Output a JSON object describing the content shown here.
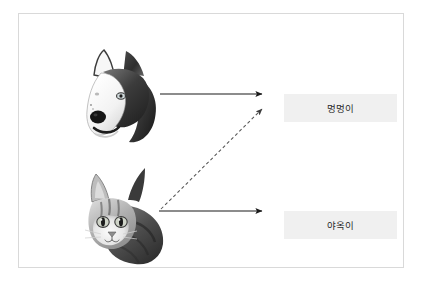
{
  "diagram": {
    "title_visible": false,
    "canvas": {
      "border_color": "#d9d9d9",
      "background_color": "#ffffff"
    },
    "nodes": [
      {
        "id": "dog-image",
        "type": "image",
        "semantic": "husky-dog-photo",
        "alt_text": "Husky dog head, grayscale photo",
        "position": "top-left"
      },
      {
        "id": "cat-image",
        "type": "image",
        "semantic": "tabby-cat-photo",
        "alt_text": "Tabby kitten head, grayscale photo",
        "position": "bottom-left"
      },
      {
        "id": "label-box-dog",
        "type": "label",
        "text": "멍멍이",
        "background_color": "#f0f0f0",
        "text_color": "#2b2b2b",
        "position": "top-right"
      },
      {
        "id": "label-box-cat",
        "type": "label",
        "text": "야옥이",
        "background_color": "#f0f0f0",
        "text_color": "#2b2b2b",
        "position": "bottom-right"
      }
    ],
    "edges": [
      {
        "id": "arrow-dog-to-meong",
        "from": "dog-image",
        "to": "label-box-dog",
        "style": "solid",
        "color": "#1a1a1a",
        "arrowhead": true
      },
      {
        "id": "arrow-cat-to-yaong",
        "from": "cat-image",
        "to": "label-box-cat",
        "style": "solid",
        "color": "#1a1a1a",
        "arrowhead": true
      },
      {
        "id": "arrow-cat-to-meong-dashed",
        "from": "cat-image",
        "to": "label-box-dog",
        "style": "dashed",
        "color": "#555555",
        "arrowhead": true
      }
    ]
  }
}
